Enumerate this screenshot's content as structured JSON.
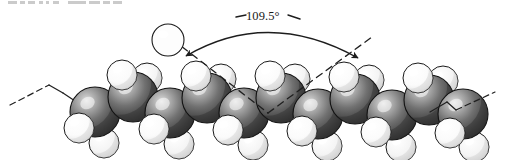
{
  "figure": {
    "kind": "space-filling-molecular-model",
    "background_color": "#ffffff"
  },
  "annotation": {
    "angle_label": "109.5°",
    "label_x": 246,
    "label_y": 9,
    "arc": {
      "start_x": 186,
      "start_y": 56,
      "end_x": 358,
      "end_y": 58,
      "apex_x": 268,
      "apex_y": 14,
      "stroke_color": "#1d1d1d",
      "stroke_width": 1.4,
      "double_headed": true
    },
    "tick_left": {
      "x1": 236,
      "y1": 17,
      "x2": 246,
      "y2": 15
    },
    "tick_right": {
      "x1": 288,
      "y1": 15,
      "x2": 300,
      "y2": 19
    }
  },
  "bond_angle_lines": {
    "stroke_color": "#1f1f1f",
    "stroke_width": 1.3,
    "dash_pattern": "7 5",
    "vertex_x": 268,
    "vertex_y": 113,
    "left_line": {
      "x1": 163,
      "y1": 32,
      "x2": 268,
      "y2": 113
    },
    "right_line": {
      "x1": 268,
      "y1": 113,
      "x2": 372,
      "y2": 37
    }
  },
  "chain_extensions": {
    "stroke_color": "#1f1f1f",
    "stroke_width": 1.2,
    "dash_pattern": "6 4",
    "left": {
      "solid": [
        {
          "x1": 49,
          "y1": 85,
          "x2": 63,
          "y2": 93
        },
        {
          "x1": 63,
          "y1": 93,
          "x2": 78,
          "y2": 103
        }
      ],
      "dashed": {
        "x1": 10,
        "y1": 105,
        "x2": 49,
        "y2": 85
      }
    },
    "right": {
      "solid": [
        {
          "x1": 430,
          "y1": 112,
          "x2": 447,
          "y2": 102
        },
        {
          "x1": 447,
          "y1": 102,
          "x2": 456,
          "y2": 110
        }
      ],
      "dashed": {
        "x1": 456,
        "y1": 110,
        "x2": 495,
        "y2": 92
      }
    }
  },
  "atoms": {
    "carbon": {
      "name": "carbon",
      "symbol": "C",
      "color_base": "#5a5a5a",
      "color_highlight": "#d2d2d2",
      "color_shadow": "#2e2e2e",
      "outline": "#111111",
      "radius": 25,
      "count": 11,
      "positions": [
        {
          "cx": 95,
          "cy": 112,
          "row": "lower"
        },
        {
          "cx": 133,
          "cy": 97,
          "row": "upper"
        },
        {
          "cx": 170,
          "cy": 113,
          "row": "lower"
        },
        {
          "cx": 207,
          "cy": 98,
          "row": "upper"
        },
        {
          "cx": 244,
          "cy": 113,
          "row": "lower"
        },
        {
          "cx": 281,
          "cy": 98,
          "row": "upper"
        },
        {
          "cx": 318,
          "cy": 114,
          "row": "lower"
        },
        {
          "cx": 355,
          "cy": 99,
          "row": "upper"
        },
        {
          "cx": 392,
          "cy": 115,
          "row": "lower"
        },
        {
          "cx": 429,
          "cy": 100,
          "row": "upper"
        },
        {
          "cx": 463,
          "cy": 114,
          "row": "lower"
        }
      ]
    },
    "hydrogen": {
      "name": "hydrogen",
      "symbol": "H",
      "color_base": "#ffffff",
      "color_highlight": "#ffffff",
      "color_shadow": "#cfcfcf",
      "outline": "#1a1a1a",
      "radius": 15,
      "count": 22,
      "positions": [
        {
          "cx": 79,
          "cy": 128,
          "depth": "front"
        },
        {
          "cx": 104,
          "cy": 143,
          "depth": "back"
        },
        {
          "cx": 122,
          "cy": 75,
          "depth": "front"
        },
        {
          "cx": 147,
          "cy": 78,
          "depth": "back"
        },
        {
          "cx": 154,
          "cy": 129,
          "depth": "front"
        },
        {
          "cx": 179,
          "cy": 144,
          "depth": "back"
        },
        {
          "cx": 196,
          "cy": 76,
          "depth": "front"
        },
        {
          "cx": 221,
          "cy": 79,
          "depth": "back"
        },
        {
          "cx": 228,
          "cy": 130,
          "depth": "front"
        },
        {
          "cx": 253,
          "cy": 145,
          "depth": "back"
        },
        {
          "cx": 270,
          "cy": 76,
          "depth": "front"
        },
        {
          "cx": 295,
          "cy": 79,
          "depth": "back"
        },
        {
          "cx": 302,
          "cy": 131,
          "depth": "front"
        },
        {
          "cx": 327,
          "cy": 146,
          "depth": "back"
        },
        {
          "cx": 344,
          "cy": 77,
          "depth": "front"
        },
        {
          "cx": 369,
          "cy": 80,
          "depth": "back"
        },
        {
          "cx": 376,
          "cy": 132,
          "depth": "front"
        },
        {
          "cx": 401,
          "cy": 147,
          "depth": "back"
        },
        {
          "cx": 418,
          "cy": 78,
          "depth": "front"
        },
        {
          "cx": 443,
          "cy": 81,
          "depth": "back"
        },
        {
          "cx": 450,
          "cy": 133,
          "depth": "front"
        },
        {
          "cx": 474,
          "cy": 147,
          "depth": "back"
        }
      ]
    },
    "callout_hydrogen": {
      "name": "callout-hydrogen",
      "cx": 168,
      "cy": 40,
      "radius": 16,
      "color_base": "#ffffff",
      "outline": "#1a1a1a",
      "note": "detached outlined hydrogen sphere at top-left of annotation"
    }
  },
  "scan_artifact": {
    "present": true,
    "description": "faint clipped text fragments along the very top edge of the scan",
    "segments": [
      {
        "x": 2,
        "w": 9
      },
      {
        "x": 14,
        "w": 5
      },
      {
        "x": 22,
        "w": 7
      },
      {
        "x": 33,
        "w": 4
      },
      {
        "x": 40,
        "w": 3
      },
      {
        "x": 47,
        "w": 6
      },
      {
        "x": 62,
        "w": 18
      },
      {
        "x": 83,
        "w": 11
      },
      {
        "x": 97,
        "w": 7
      },
      {
        "x": 107,
        "w": 9
      }
    ]
  }
}
